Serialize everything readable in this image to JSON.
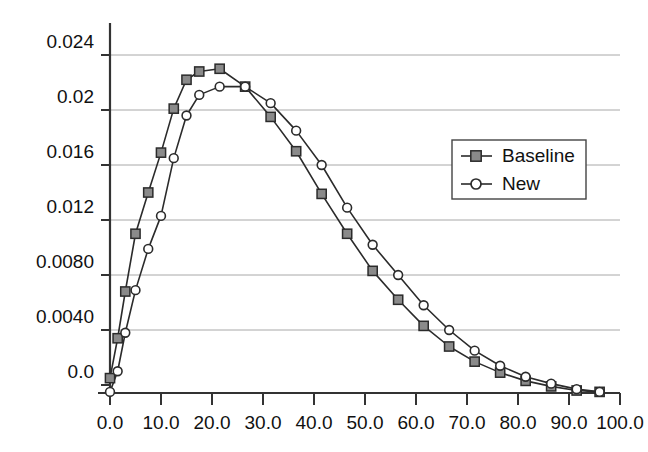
{
  "chart_data": {
    "type": "line",
    "title": "",
    "subtitle": "",
    "xlabel": "",
    "ylabel": "",
    "xlim": [
      0.0,
      100.0
    ],
    "ylim": [
      -0.0012,
      0.0258
    ],
    "grid": true,
    "grid_axis": "y",
    "legend_position": "upper-right",
    "xticks": [
      0.0,
      10.0,
      20.0,
      30.0,
      40.0,
      50.0,
      60.0,
      70.0,
      80.0,
      90.0,
      100.0
    ],
    "xticklabels": [
      "0.0",
      "10.0",
      "20.0",
      "30.0",
      "40.0",
      "50.0",
      "60.0",
      "70.0",
      "80.0",
      "90.0",
      "100.0"
    ],
    "yticks": [
      0.0,
      0.004,
      0.008,
      0.012,
      0.016,
      0.02,
      0.024
    ],
    "yticklabels": [
      "0.0",
      "0.0040",
      "0.0080",
      "0.012",
      "0.016",
      "0.02",
      "0.024"
    ],
    "series": [
      {
        "name": "Baseline",
        "marker": "filled-square",
        "marker_fill": "#8a8a8a",
        "marker_edge": "#2b2b2b",
        "line_color": "#2b2b2b",
        "x": [
          0.0,
          1.5,
          3.0,
          5.0,
          7.5,
          10.0,
          12.5,
          15.0,
          17.5,
          21.5,
          26.5,
          31.5,
          36.5,
          41.5,
          46.5,
          51.5,
          56.5,
          61.5,
          66.5,
          71.5,
          76.5,
          81.5,
          86.5,
          91.5,
          96.0
        ],
        "y": [
          0.0005,
          0.0034,
          0.0068,
          0.011,
          0.014,
          0.0169,
          0.0201,
          0.0222,
          0.0228,
          0.023,
          0.0217,
          0.0195,
          0.017,
          0.0139,
          0.011,
          0.0083,
          0.0062,
          0.0043,
          0.0028,
          0.0017,
          0.0009,
          0.0003,
          -0.0001,
          -0.0004,
          -0.0005
        ]
      },
      {
        "name": "New",
        "marker": "open-circle",
        "marker_fill": "#ffffff",
        "marker_edge": "#2b2b2b",
        "line_color": "#2b2b2b",
        "x": [
          0.0,
          1.5,
          3.0,
          5.0,
          7.5,
          10.0,
          12.5,
          15.0,
          17.5,
          21.5,
          26.5,
          31.5,
          36.5,
          41.5,
          46.5,
          51.5,
          56.5,
          61.5,
          66.5,
          71.5,
          76.5,
          81.5,
          86.5,
          91.5,
          96.0
        ],
        "y": [
          -0.0005,
          0.001,
          0.0038,
          0.0069,
          0.0099,
          0.0123,
          0.0165,
          0.0196,
          0.0211,
          0.0217,
          0.0217,
          0.0205,
          0.0185,
          0.016,
          0.0129,
          0.0102,
          0.008,
          0.0058,
          0.004,
          0.0025,
          0.0014,
          0.0006,
          0.0001,
          -0.0003,
          -0.0005
        ]
      }
    ],
    "legend": [
      {
        "label": "Baseline",
        "marker": "filled-square"
      },
      {
        "label": "New",
        "marker": "open-circle"
      }
    ],
    "colors": {
      "line": "#2b2b2b",
      "marker_fill_baseline": "#8a8a8a",
      "marker_fill_new": "#ffffff",
      "grid": "#a8a8a8",
      "axis": "#333333",
      "background": "#ffffff"
    }
  }
}
